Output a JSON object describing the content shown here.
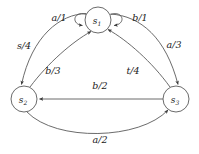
{
  "diagram": {
    "type": "finite-state-machine",
    "title": "",
    "background_color": "#ffffff",
    "line_color": "#5a5a5a",
    "text_color": "#1a1a1a",
    "states": [
      {
        "id": "s1",
        "name": "s",
        "subscript": "1",
        "cx": 98,
        "cy": 20,
        "r": 13
      },
      {
        "id": "s2",
        "name": "s",
        "subscript": "2",
        "cx": 24,
        "cy": 99,
        "r": 13
      },
      {
        "id": "s3",
        "name": "s",
        "subscript": "3",
        "cx": 176,
        "cy": 99,
        "r": 13
      }
    ],
    "transitions": [
      {
        "id": "t1",
        "from": "s1",
        "to": "s1",
        "input": "a",
        "output": "1",
        "label": "a/1",
        "label_x": 59,
        "label_y": 17,
        "kind": "self-loop-left"
      },
      {
        "id": "t2",
        "from": "s1",
        "to": "s1",
        "input": "b",
        "output": "1",
        "label": "b/1",
        "label_x": 140,
        "label_y": 17,
        "kind": "self-loop-right"
      },
      {
        "id": "t3",
        "from": "s1",
        "to": "s2",
        "input": "s",
        "output": "4",
        "label": "s/4",
        "label_x": 24,
        "label_y": 45,
        "kind": "curve-left-outer"
      },
      {
        "id": "t4",
        "from": "s2",
        "to": "s1",
        "input": "b",
        "output": "3",
        "label": "b/3",
        "label_x": 53,
        "label_y": 70,
        "kind": "curve-left-inner"
      },
      {
        "id": "t5",
        "from": "s1",
        "to": "s3",
        "input": "a",
        "output": "3",
        "label": "a/3",
        "label_x": 174,
        "label_y": 44,
        "kind": "curve-right-outer"
      },
      {
        "id": "t6",
        "from": "s3",
        "to": "s1",
        "input": "t",
        "output": "4",
        "label": "t/4",
        "label_x": 133,
        "label_y": 70,
        "kind": "curve-right-inner"
      },
      {
        "id": "t7",
        "from": "s3",
        "to": "s2",
        "input": "b",
        "output": "2",
        "label": "b/2",
        "label_x": 100,
        "label_y": 85,
        "kind": "straight-horizontal"
      },
      {
        "id": "t8",
        "from": "s2",
        "to": "s3",
        "input": "a",
        "output": "2",
        "label": "a/2",
        "label_x": 100,
        "label_y": 139,
        "kind": "curve-bottom"
      }
    ]
  }
}
